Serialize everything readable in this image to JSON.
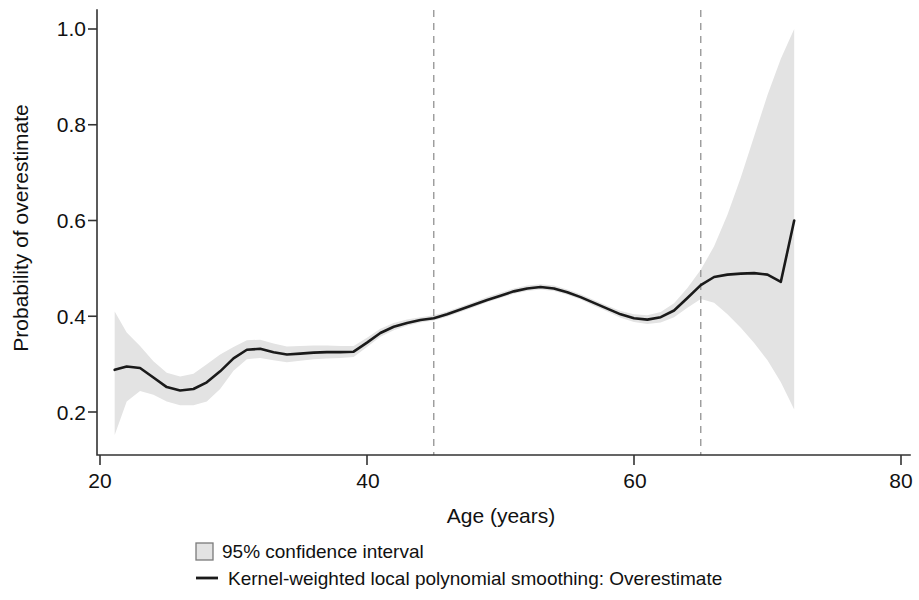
{
  "chart_data": {
    "type": "line",
    "title": "",
    "subtitle": "",
    "xlabel": "Age (years)",
    "ylabel": "Probability of overestimate",
    "xlim": [
      20,
      80
    ],
    "ylim": [
      0.13,
      1.02
    ],
    "xticks": [
      20,
      40,
      60,
      80
    ],
    "xtick_labels": [
      "20",
      "40",
      "60",
      "80"
    ],
    "yticks": [
      0.2,
      0.4,
      0.6,
      0.8,
      1.0
    ],
    "ytick_labels": [
      "0.2",
      "0.4",
      "0.6",
      "0.8",
      "1.0"
    ],
    "grid": false,
    "legend_position": "bottom",
    "series": [
      {
        "name": "Kernel-weighted local polynomial smoothing: Overestimate",
        "type": "line",
        "color": "#1a1a1a",
        "x": [
          21.1,
          22.0,
          23.0,
          24.0,
          25.0,
          26.0,
          27.0,
          28.0,
          29.0,
          30.0,
          31.0,
          32.0,
          33.0,
          34.0,
          35.0,
          36.0,
          37.0,
          38.0,
          39.0,
          40.0,
          41.0,
          42.0,
          43.0,
          44.0,
          45.0,
          46.0,
          47.0,
          48.0,
          49.0,
          50.0,
          51.0,
          52.0,
          53.0,
          54.0,
          55.0,
          56.0,
          57.0,
          58.0,
          59.0,
          60.0,
          61.0,
          62.0,
          63.0,
          64.0,
          65.0,
          66.0,
          67.0,
          68.0,
          69.0,
          70.0,
          71.0,
          72.0
        ],
        "y": [
          0.288,
          0.295,
          0.292,
          0.272,
          0.252,
          0.245,
          0.248,
          0.262,
          0.285,
          0.312,
          0.33,
          0.332,
          0.325,
          0.32,
          0.322,
          0.324,
          0.325,
          0.325,
          0.326,
          0.345,
          0.365,
          0.378,
          0.386,
          0.392,
          0.396,
          0.404,
          0.414,
          0.424,
          0.434,
          0.443,
          0.452,
          0.458,
          0.461,
          0.458,
          0.45,
          0.44,
          0.428,
          0.416,
          0.404,
          0.396,
          0.393,
          0.398,
          0.412,
          0.438,
          0.465,
          0.482,
          0.487,
          0.489,
          0.49,
          0.487,
          0.472,
          0.6
        ]
      },
      {
        "name": "95% confidence interval",
        "type": "band",
        "color": "#e3e3e3",
        "x": [
          21.1,
          22.0,
          23.0,
          24.0,
          25.0,
          26.0,
          27.0,
          28.0,
          29.0,
          30.0,
          31.0,
          32.0,
          33.0,
          34.0,
          35.0,
          36.0,
          37.0,
          38.0,
          39.0,
          40.0,
          41.0,
          42.0,
          43.0,
          44.0,
          45.0,
          46.0,
          47.0,
          48.0,
          49.0,
          50.0,
          51.0,
          52.0,
          53.0,
          54.0,
          55.0,
          56.0,
          57.0,
          58.0,
          59.0,
          60.0,
          61.0,
          62.0,
          63.0,
          64.0,
          65.0,
          66.0,
          67.0,
          68.0,
          69.0,
          70.0,
          71.0,
          72.0
        ],
        "lower": [
          0.152,
          0.222,
          0.244,
          0.236,
          0.222,
          0.214,
          0.214,
          0.222,
          0.248,
          0.286,
          0.31,
          0.313,
          0.308,
          0.304,
          0.307,
          0.31,
          0.312,
          0.313,
          0.315,
          0.336,
          0.357,
          0.371,
          0.38,
          0.387,
          0.391,
          0.399,
          0.409,
          0.419,
          0.429,
          0.438,
          0.447,
          0.453,
          0.456,
          0.453,
          0.445,
          0.435,
          0.422,
          0.41,
          0.397,
          0.388,
          0.384,
          0.387,
          0.398,
          0.418,
          0.436,
          0.428,
          0.404,
          0.376,
          0.344,
          0.308,
          0.262,
          0.205
        ],
        "upper": [
          0.41,
          0.366,
          0.338,
          0.306,
          0.282,
          0.274,
          0.28,
          0.3,
          0.32,
          0.336,
          0.35,
          0.351,
          0.343,
          0.337,
          0.338,
          0.339,
          0.339,
          0.338,
          0.338,
          0.355,
          0.374,
          0.386,
          0.393,
          0.398,
          0.402,
          0.41,
          0.42,
          0.43,
          0.44,
          0.449,
          0.458,
          0.464,
          0.467,
          0.464,
          0.456,
          0.446,
          0.434,
          0.422,
          0.411,
          0.404,
          0.402,
          0.409,
          0.427,
          0.459,
          0.497,
          0.546,
          0.612,
          0.69,
          0.776,
          0.862,
          0.938,
          1.0
        ]
      }
    ],
    "reference_lines": [
      {
        "name": "age-45-reference",
        "orientation": "vertical",
        "value": 45,
        "style": "dashed",
        "color": "#9a9a9a"
      },
      {
        "name": "age-65-reference",
        "orientation": "vertical",
        "value": 65,
        "style": "dashed",
        "color": "#9a9a9a"
      }
    ],
    "legend": [
      {
        "label": "95% confidence interval",
        "marker": "filled-square",
        "color": "#e3e3e3"
      },
      {
        "label": "Kernel-weighted local polynomial smoothing: Overestimate",
        "marker": "line",
        "color": "#1a1a1a"
      }
    ]
  },
  "axes": {
    "x_title": "Age (years)",
    "y_title": "Probability of overestimate"
  },
  "colors": {
    "line": "#1a1a1a",
    "band": "#e3e3e3",
    "axis": "#333333",
    "reference": "#9a9a9a",
    "background": "#ffffff"
  }
}
